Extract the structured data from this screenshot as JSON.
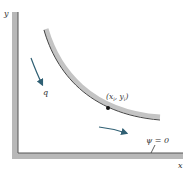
{
  "diagram": {
    "axes": {
      "x_label": "x",
      "y_label": "y"
    },
    "labels": {
      "point": "(xᵢ, yᵢ)",
      "point_x": "x",
      "point_sub_x": "i",
      "point_y": "y",
      "point_sub_y": "i",
      "flow": "q",
      "streamline": "ψ = 0"
    },
    "colors": {
      "wall": "#b8b8b8",
      "wall_edge": "#555555",
      "arrow": "#2f5f73",
      "text": "#333333"
    }
  }
}
